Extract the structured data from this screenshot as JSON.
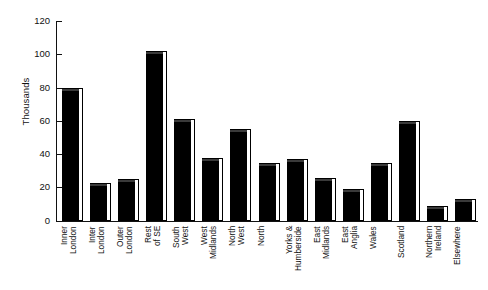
{
  "chart_data": {
    "type": "bar",
    "title": "",
    "xlabel": "",
    "ylabel": "Thousands",
    "ylim": [
      0,
      120
    ],
    "yticks": [
      0,
      20,
      40,
      60,
      80,
      100,
      120
    ],
    "grid": false,
    "legend": "none",
    "orientation": "vertical",
    "categories": [
      "Inner London",
      "Inter London",
      "Outer London",
      "Rest of SE",
      "South West",
      "West Midlands",
      "North West",
      "North",
      "Yorks & Humberside",
      "East Midlands",
      "East Anglia",
      "Wales",
      "Scotland",
      "Northern Ireland",
      "Elsewhere"
    ],
    "category_lines": [
      [
        "Inner",
        "London"
      ],
      [
        "Inter",
        "London"
      ],
      [
        "Outer",
        "London"
      ],
      [
        "Rest",
        "of SE"
      ],
      [
        "South",
        "West"
      ],
      [
        "West",
        "Midlands"
      ],
      [
        "North",
        "West"
      ],
      [
        "North",
        ""
      ],
      [
        "Yorks &",
        "Humberside"
      ],
      [
        "East",
        "Midlands"
      ],
      [
        "East",
        "Anglia"
      ],
      [
        "Wales",
        ""
      ],
      [
        "Scotland",
        ""
      ],
      [
        "Northern",
        "Ireland"
      ],
      [
        "Elsewhere",
        ""
      ]
    ],
    "values": [
      78,
      21,
      23,
      100,
      59,
      36,
      53,
      33,
      35,
      24,
      17,
      33,
      58,
      7,
      11
    ],
    "units": "Thousands",
    "bar_color": "#000000"
  }
}
